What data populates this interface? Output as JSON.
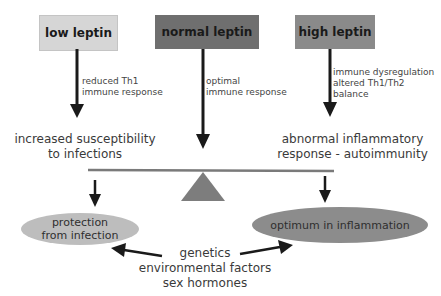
{
  "diagram": {
    "boxes": {
      "low": {
        "label": "low leptin",
        "color": "#d6d6d6"
      },
      "normal": {
        "label": "normal leptin",
        "color": "#6f6f6f"
      },
      "high": {
        "label": "high leptin",
        "color": "#8a8a8a"
      }
    },
    "arrow_labels": {
      "low": [
        "reduced Th1",
        "immune response"
      ],
      "normal": [
        "optimal",
        "immune response"
      ],
      "high": [
        "immune dysregulation",
        "altered Th1/Th2",
        "balance"
      ]
    },
    "outcomes": {
      "left": [
        "increased susceptibility",
        "to infections"
      ],
      "right": [
        "abnormal inflammatory",
        "response - autoimmunity"
      ]
    },
    "ellipses": {
      "left": {
        "lines": [
          "protection",
          "from infection"
        ],
        "color": "#bdbdbd"
      },
      "right": {
        "lines": [
          "optimum in inflammation"
        ],
        "color": "#8c8c8c"
      }
    },
    "factors": [
      "genetics",
      "environmental factors",
      "sex hormones"
    ],
    "balance": {
      "beam_color": "#7a7a7a",
      "fulcrum_color": "#7d7d7d"
    }
  }
}
